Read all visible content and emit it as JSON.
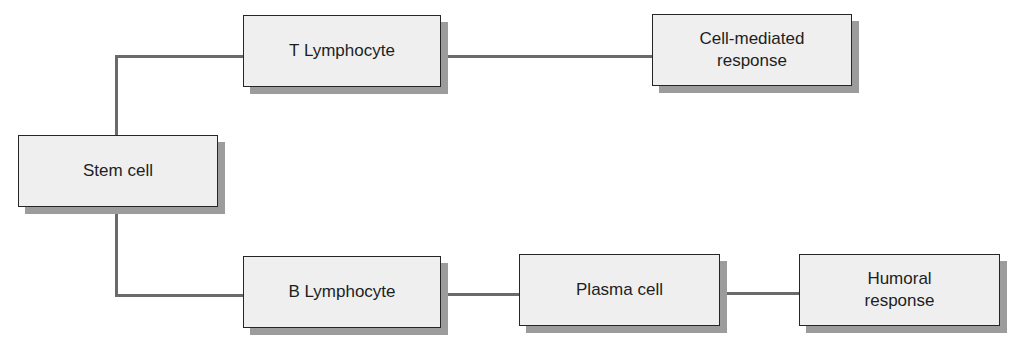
{
  "diagram": {
    "type": "flowchart",
    "colors": {
      "box_fill": "#efefef",
      "box_border": "#262626",
      "box_shadow": "#9c9c9c",
      "connector": "#6a6a6a",
      "text": "#1e1e1e"
    },
    "nodes": {
      "stem_cell": {
        "label": "Stem cell"
      },
      "t_lymphocyte": {
        "label": "T Lymphocyte"
      },
      "cell_mediated_response": {
        "label": "Cell-mediated\nresponse"
      },
      "b_lymphocyte": {
        "label": "B Lymphocyte"
      },
      "plasma_cell": {
        "label": "Plasma cell"
      },
      "humoral_response": {
        "label": "Humoral\nresponse"
      }
    },
    "edges": [
      {
        "from": "stem_cell",
        "to": "t_lymphocyte"
      },
      {
        "from": "t_lymphocyte",
        "to": "cell_mediated_response"
      },
      {
        "from": "stem_cell",
        "to": "b_lymphocyte"
      },
      {
        "from": "b_lymphocyte",
        "to": "plasma_cell"
      },
      {
        "from": "plasma_cell",
        "to": "humoral_response"
      }
    ]
  }
}
